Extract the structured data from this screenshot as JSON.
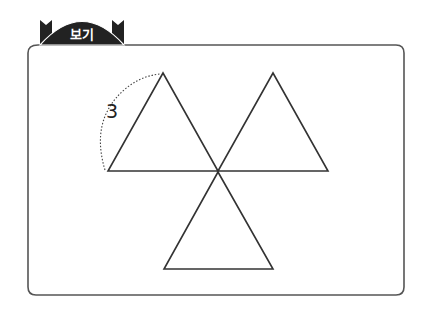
{
  "header": {
    "badge_label": "보기"
  },
  "figure": {
    "side_length_label": "3",
    "shapes": [
      {
        "name": "upper-left-triangle",
        "apex": [
          163,
          73
        ],
        "base": [
          [
            108,
            171
          ],
          [
            218,
            171
          ]
        ]
      },
      {
        "name": "upper-right-triangle",
        "apex": [
          273,
          73
        ],
        "base": [
          [
            218,
            171
          ],
          [
            328,
            171
          ]
        ]
      },
      {
        "name": "lower-triangle",
        "apex": [
          218,
          172
        ],
        "base": [
          [
            164,
            269
          ],
          [
            273,
            269
          ]
        ]
      }
    ],
    "colors": {
      "stroke": "#333333",
      "badge": "#222222",
      "background": "#ffffff"
    }
  }
}
